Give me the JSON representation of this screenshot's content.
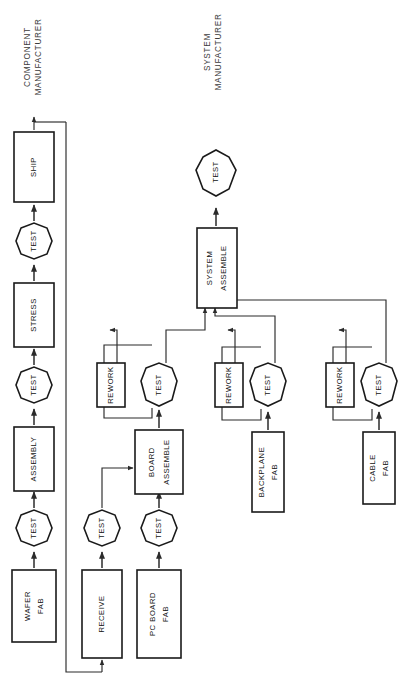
{
  "diagram": {
    "orientation": "rotated-90-ccw",
    "colors": {
      "background": "#ffffff",
      "node_fill": "#ffffff",
      "node_stroke": "#1a1a1a",
      "link_stroke": "#2b2b2b",
      "label_text": "#111111",
      "group_text": "#3c3c3c"
    },
    "groups": [
      {
        "id": "component-manufacturer",
        "line1": "COMPONENT",
        "line2": "MANUFACTURER"
      },
      {
        "id": "system-manufacturer",
        "line1": "SYSTEM",
        "line2": "MANUFACTURER"
      }
    ],
    "nodes": [
      {
        "id": "wafer-fab",
        "shape": "box",
        "line1": "WAFER",
        "line2": "FAB"
      },
      {
        "id": "test-wafer",
        "shape": "octagon",
        "line1": "TEST",
        "line2": ""
      },
      {
        "id": "assembly",
        "shape": "box",
        "line1": "ASSEMBLY",
        "line2": ""
      },
      {
        "id": "test-assembly",
        "shape": "octagon",
        "line1": "TEST",
        "line2": ""
      },
      {
        "id": "stress",
        "shape": "box",
        "line1": "STRESS",
        "line2": ""
      },
      {
        "id": "test-stress",
        "shape": "octagon",
        "line1": "TEST",
        "line2": ""
      },
      {
        "id": "ship",
        "shape": "box",
        "line1": "SHIP",
        "line2": ""
      },
      {
        "id": "receive",
        "shape": "box",
        "line1": "RECEIVE",
        "line2": ""
      },
      {
        "id": "test-receive",
        "shape": "octagon",
        "line1": "TEST",
        "line2": ""
      },
      {
        "id": "pc-board-fab",
        "shape": "box",
        "line1": "PC BOARD",
        "line2": "FAB"
      },
      {
        "id": "test-pc-board",
        "shape": "octagon",
        "line1": "TEST",
        "line2": ""
      },
      {
        "id": "board-assemble",
        "shape": "box",
        "line1": "BOARD",
        "line2": "ASSEMBLE"
      },
      {
        "id": "test-board",
        "shape": "octagon",
        "line1": "TEST",
        "line2": ""
      },
      {
        "id": "rework-board",
        "shape": "box",
        "line1": "REWORK",
        "line2": ""
      },
      {
        "id": "backplane-fab",
        "shape": "box",
        "line1": "BACKPLANE",
        "line2": "FAB"
      },
      {
        "id": "test-backplane",
        "shape": "octagon",
        "line1": "TEST",
        "line2": ""
      },
      {
        "id": "rework-backplane",
        "shape": "box",
        "line1": "REWORK",
        "line2": ""
      },
      {
        "id": "cable-fab",
        "shape": "box",
        "line1": "CABLE",
        "line2": "FAB"
      },
      {
        "id": "test-cable",
        "shape": "octagon",
        "line1": "TEST",
        "line2": ""
      },
      {
        "id": "rework-cable",
        "shape": "box",
        "line1": "REWORK",
        "line2": ""
      },
      {
        "id": "system-assemble",
        "shape": "box",
        "line1": "SYSTEM",
        "line2": "ASSEMBLE"
      },
      {
        "id": "test-system",
        "shape": "octagon",
        "line1": "TEST",
        "line2": ""
      }
    ],
    "edges": [
      {
        "from": "wafer-fab",
        "to": "test-wafer"
      },
      {
        "from": "test-wafer",
        "to": "assembly"
      },
      {
        "from": "assembly",
        "to": "test-assembly"
      },
      {
        "from": "test-assembly",
        "to": "stress"
      },
      {
        "from": "stress",
        "to": "test-stress"
      },
      {
        "from": "test-stress",
        "to": "ship"
      },
      {
        "from": "ship",
        "to": "receive"
      },
      {
        "from": "receive",
        "to": "test-receive"
      },
      {
        "from": "test-receive",
        "to": "board-assemble"
      },
      {
        "from": "pc-board-fab",
        "to": "test-pc-board"
      },
      {
        "from": "test-pc-board",
        "to": "board-assemble"
      },
      {
        "from": "board-assemble",
        "to": "test-board"
      },
      {
        "from": "test-board",
        "to": "rework-board"
      },
      {
        "from": "rework-board",
        "to": "test-board"
      },
      {
        "from": "test-board",
        "to": "system-assemble"
      },
      {
        "from": "backplane-fab",
        "to": "test-backplane"
      },
      {
        "from": "test-backplane",
        "to": "rework-backplane"
      },
      {
        "from": "rework-backplane",
        "to": "test-backplane"
      },
      {
        "from": "test-backplane",
        "to": "system-assemble"
      },
      {
        "from": "cable-fab",
        "to": "test-cable"
      },
      {
        "from": "test-cable",
        "to": "rework-cable"
      },
      {
        "from": "rework-cable",
        "to": "test-cable"
      },
      {
        "from": "test-cable",
        "to": "system-assemble"
      },
      {
        "from": "system-assemble",
        "to": "test-system"
      }
    ]
  }
}
